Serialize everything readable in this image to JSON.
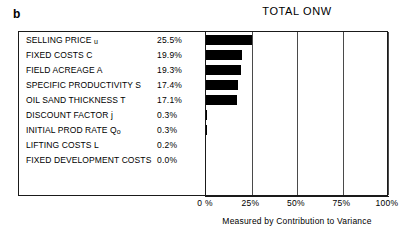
{
  "panel": {
    "letter": "b"
  },
  "chart_data": {
    "type": "bar",
    "orientation": "horizontal",
    "title": "TOTAL ONW",
    "xlabel": "Measured by Contribution to Variance",
    "ylabel": "",
    "xlim": [
      0,
      100
    ],
    "xtick_labels": [
      "0 %",
      "25%",
      "50%",
      "75%",
      "100%"
    ],
    "xticks": [
      0,
      25,
      50,
      75,
      100
    ],
    "grid": true,
    "gridlines_at": [
      25,
      50,
      75,
      100
    ],
    "legend": "none",
    "bar_color": "#000000",
    "categories": [
      "SELLING PRICE u",
      "FIXED COSTS C",
      "FIELD ACREAGE A",
      "SPECIFIC PRODUCTIVITY S",
      "OIL SAND THICKNESS T",
      "DISCOUNT FACTOR j",
      "INITIAL PROD RATE Qo",
      "LIFTING COSTS L",
      "FIXED DEVELOPMENT COSTS"
    ],
    "values": [
      25.5,
      19.9,
      19.3,
      17.4,
      17.1,
      0.3,
      0.3,
      0.2,
      0.0
    ],
    "value_labels": [
      "25.5%",
      "19.9%",
      "19.3%",
      "17.4%",
      "17.1%",
      "0.3%",
      "0.3%",
      "0.2%",
      "0.0%"
    ],
    "rows": [
      {
        "label_main": "SELLING PRICE ",
        "label_sub": "u",
        "value_label": "25.5%",
        "value": 25.5
      },
      {
        "label_main": "FIXED COSTS C",
        "label_sub": "",
        "value_label": "19.9%",
        "value": 19.9
      },
      {
        "label_main": "FIELD ACREAGE A",
        "label_sub": "",
        "value_label": "19.3%",
        "value": 19.3
      },
      {
        "label_main": "SPECIFIC PRODUCTIVITY S",
        "label_sub": "",
        "value_label": "17.4%",
        "value": 17.4
      },
      {
        "label_main": "OIL SAND THICKNESS T",
        "label_sub": "",
        "value_label": "17.1%",
        "value": 17.1
      },
      {
        "label_main": "DISCOUNT FACTOR j",
        "label_sub": "",
        "value_label": "0.3%",
        "value": 0.3
      },
      {
        "label_main": "INITIAL PROD RATE Q",
        "label_sub": "o",
        "value_label": "0.3%",
        "value": 0.3
      },
      {
        "label_main": "LIFTING COSTS L",
        "label_sub": "",
        "value_label": "0.2%",
        "value": 0.2
      },
      {
        "label_main": "FIXED DEVELOPMENT COSTS",
        "label_sub": "",
        "value_label": "0.0%",
        "value": 0.0
      }
    ]
  }
}
